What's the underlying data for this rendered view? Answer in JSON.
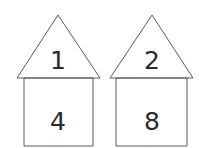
{
  "figure": {
    "title": "",
    "background_color": "#ffffff",
    "stroke_color": "#5a5a5a",
    "text_color": "#2b2b2b",
    "houses": [
      {
        "name": "left-house",
        "roof": {
          "label": "1",
          "apex": {
            "x": 58,
            "y": 15
          },
          "base_left": {
            "x": 17,
            "y": 78
          },
          "base_right": {
            "x": 100,
            "y": 78
          },
          "label_x": 58,
          "label_y": 60
        },
        "body": {
          "label": "4",
          "left": 24,
          "top": 78,
          "right": 93,
          "bottom": 146,
          "label_x": 58,
          "label_y": 121
        }
      },
      {
        "name": "right-house",
        "roof": {
          "label": "2",
          "apex": {
            "x": 152,
            "y": 15
          },
          "base_left": {
            "x": 110,
            "y": 78
          },
          "base_right": {
            "x": 193,
            "y": 78
          },
          "label_x": 152,
          "label_y": 60
        },
        "body": {
          "label": "8",
          "left": 116,
          "top": 78,
          "right": 187,
          "bottom": 146,
          "label_x": 152,
          "label_y": 121
        }
      }
    ]
  }
}
